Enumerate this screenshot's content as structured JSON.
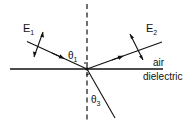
{
  "diagram": {
    "type": "reflection-refraction",
    "colors": {
      "ink": "#111111",
      "background": "#ffffff"
    },
    "labels": {
      "incident_field": {
        "main": "E",
        "sub": "1"
      },
      "reflected_field": {
        "main": "E",
        "sub": "2"
      },
      "incident_angle": {
        "main": "θ",
        "sub": "1"
      },
      "refracted_angle": {
        "main": "θ",
        "sub": "3"
      },
      "upper_medium": "air",
      "lower_medium": "dielectric"
    },
    "elements": [
      "dashed normal line",
      "interface line",
      "incident ray with arrow",
      "reflected ray with arrow",
      "refracted ray",
      "E1 double-headed field arrow",
      "E2 double-headed field arrow"
    ]
  }
}
